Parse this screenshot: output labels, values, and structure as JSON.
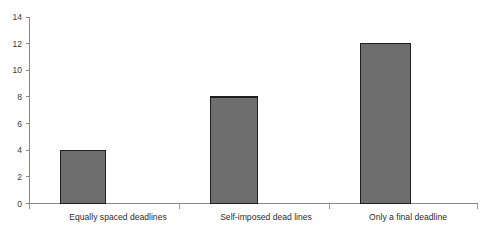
{
  "chart_data": {
    "type": "bar",
    "title": "",
    "subtitle": "",
    "xlabel": "",
    "ylabel": "",
    "categories": [
      "Equally spaced deadlines",
      "Self-imposed dead lines",
      "Only a final deadline"
    ],
    "values": [
      4,
      8,
      12
    ],
    "ylim": [
      0,
      14
    ],
    "ytick_labels": [
      "0",
      "2",
      "4",
      "6",
      "8",
      "10",
      "12",
      "14"
    ],
    "ytick_values": [
      0,
      2,
      4,
      6,
      8,
      10,
      12,
      14
    ],
    "grid": false,
    "legend": false,
    "legend_position": "none",
    "bar_fill_color": "#6e6e6e",
    "bar_border_color": "#1f1f1f",
    "axis_color": "#8a8a8a",
    "background_color": "#ffffff"
  },
  "axis": {
    "y_axis_name": "y-axis",
    "x_axis_name": "x-axis"
  }
}
